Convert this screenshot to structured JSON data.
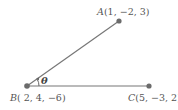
{
  "diagram": {
    "points": {
      "A": {
        "name": "A",
        "coords": "(1, −2, 3)"
      },
      "B": {
        "name": "B",
        "coords": "( 2, 4, −6)"
      },
      "C": {
        "name": "C",
        "coords": "(5, −3, 2)"
      }
    },
    "angle_label": "θ",
    "colors": {
      "line": "#777777",
      "point": "#6b6b6b",
      "text": "#555555"
    }
  }
}
